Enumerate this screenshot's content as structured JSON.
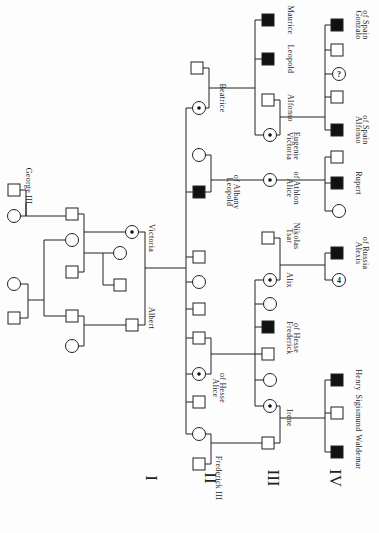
{
  "orientation": "rotated 90° clockwise (generations run left to right)",
  "generations": [
    {
      "label": "I",
      "x": 146,
      "y": 478
    },
    {
      "label": "II",
      "x": 205,
      "y": 478
    },
    {
      "label": "III",
      "x": 268,
      "y": 478
    },
    {
      "label": "IV",
      "x": 330,
      "y": 478
    }
  ],
  "legend_semantics": {
    "square": "male",
    "circle": "female",
    "filled_square": "affected male (hemophilia)",
    "dotted_circle": "carrier female",
    "question_circle": "unknown status female",
    "number_circle": "number of unaffected females"
  },
  "nodes": [
    {
      "id": "george3",
      "shape": "square",
      "x": 14,
      "y": 190,
      "label": "George III",
      "lx": 26,
      "ly": 186
    },
    {
      "id": "g3wife",
      "shape": "circle",
      "x": 14,
      "y": 216
    },
    {
      "id": "edward",
      "shape": "square",
      "x": 72,
      "y": 214
    },
    {
      "id": "aunt1",
      "shape": "circle",
      "x": 72,
      "y": 240
    },
    {
      "id": "aunt2",
      "shape": "square",
      "x": 72,
      "y": 272
    },
    {
      "id": "uncle1",
      "shape": "circle",
      "x": 14,
      "y": 284
    },
    {
      "id": "uncle1m",
      "shape": "square",
      "x": 14,
      "y": 318
    },
    {
      "id": "ernst",
      "shape": "square",
      "x": 72,
      "y": 316
    },
    {
      "id": "ernstw",
      "shape": "circle",
      "x": 72,
      "y": 346
    },
    {
      "id": "vsib1",
      "shape": "circle",
      "x": 120,
      "y": 253
    },
    {
      "id": "vsib2",
      "shape": "square",
      "x": 120,
      "y": 285
    },
    {
      "id": "victoria",
      "shape": "circle",
      "state": "carrier",
      "x": 132,
      "y": 232,
      "label": "Victoria",
      "lx": 149,
      "ly": 238
    },
    {
      "id": "albert",
      "shape": "square",
      "x": 132,
      "y": 325,
      "label": "Albert",
      "lx": 149,
      "ly": 318
    },
    {
      "id": "beatrice_h",
      "shape": "square",
      "x": 197,
      "y": 68
    },
    {
      "id": "beatrice",
      "shape": "circle",
      "state": "carrier",
      "x": 199,
      "y": 108,
      "label": "Beatrice",
      "lx": 220,
      "ly": 98
    },
    {
      "id": "leopold_w",
      "shape": "circle",
      "x": 199,
      "y": 155
    },
    {
      "id": "leopold",
      "shape": "square",
      "state": "affected",
      "x": 199,
      "y": 192,
      "label": "Leopold",
      "lx": 227,
      "ly": 192,
      "label2": "of Albany",
      "lx2": 234,
      "ly2": 192
    },
    {
      "id": "ii_5",
      "shape": "square",
      "x": 199,
      "y": 257
    },
    {
      "id": "ii_6",
      "shape": "circle",
      "x": 199,
      "y": 282
    },
    {
      "id": "ii_7",
      "shape": "square",
      "x": 199,
      "y": 309
    },
    {
      "id": "ii_8",
      "shape": "square",
      "x": 199,
      "y": 338
    },
    {
      "id": "alice",
      "shape": "circle",
      "state": "carrier",
      "x": 199,
      "y": 374,
      "label": "Alice",
      "lx": 213,
      "ly": 388,
      "label2": "of Hesse",
      "lx2": 220,
      "ly2": 388
    },
    {
      "id": "ii_10",
      "shape": "square",
      "x": 199,
      "y": 402
    },
    {
      "id": "vicky",
      "shape": "circle",
      "x": 199,
      "y": 434
    },
    {
      "id": "fred3",
      "shape": "square",
      "x": 199,
      "y": 464,
      "label": "Frederick III",
      "lx": 216,
      "ly": 478
    },
    {
      "id": "maurice",
      "shape": "square",
      "state": "affected",
      "x": 268,
      "y": 20,
      "label": "Maurice",
      "lx": 288,
      "ly": 20
    },
    {
      "id": "leopold_b",
      "shape": "square",
      "state": "affected",
      "x": 268,
      "y": 59,
      "label": "Leopold",
      "lx": 288,
      "ly": 59
    },
    {
      "id": "alfonso13",
      "shape": "square",
      "x": 268,
      "y": 100,
      "label": "Alfonso",
      "lx": 288,
      "ly": 108
    },
    {
      "id": "vic_eug",
      "shape": "circle",
      "state": "carrier",
      "x": 270,
      "y": 135,
      "label": "Victoria",
      "lx": 287,
      "ly": 146,
      "label2": "Eugenie",
      "lx2": 294,
      "ly2": 146
    },
    {
      "id": "alice_ath",
      "shape": "circle",
      "state": "carrier",
      "x": 270,
      "y": 180,
      "label": "Alice",
      "lx": 287,
      "ly": 188,
      "label2": "of Athlon",
      "lx2": 294,
      "ly2": 188
    },
    {
      "id": "nicholas",
      "shape": "square",
      "x": 268,
      "y": 238,
      "label": "Tsar",
      "lx": 287,
      "ly": 236,
      "label2": "Nikolas",
      "lx2": 294,
      "ly2": 236
    },
    {
      "id": "alix",
      "shape": "circle",
      "state": "carrier",
      "x": 270,
      "y": 280,
      "label": "Alix",
      "lx": 287,
      "ly": 280
    },
    {
      "id": "iii_h2",
      "shape": "circle",
      "x": 270,
      "y": 304
    },
    {
      "id": "fred_hesse",
      "shape": "square",
      "state": "affected",
      "x": 268,
      "y": 327,
      "label": "Frederick",
      "lx": 287,
      "ly": 338,
      "label2": "of Hesse",
      "lx2": 294,
      "ly2": 338
    },
    {
      "id": "iii_h4",
      "shape": "square",
      "x": 268,
      "y": 354
    },
    {
      "id": "iii_h5",
      "shape": "circle",
      "x": 270,
      "y": 380
    },
    {
      "id": "irene",
      "shape": "circle",
      "state": "carrier",
      "x": 270,
      "y": 406,
      "label": "Irene",
      "lx": 287,
      "ly": 418
    },
    {
      "id": "henry_pr",
      "shape": "square",
      "x": 268,
      "y": 443
    },
    {
      "id": "gonzalo",
      "shape": "square",
      "state": "affected",
      "x": 337,
      "y": 25,
      "label": "Gonzalo",
      "lx": 356,
      "ly": 25,
      "label2": "of Spain",
      "lx2": 363,
      "ly2": 25
    },
    {
      "id": "iv_s2",
      "shape": "square",
      "x": 337,
      "y": 50
    },
    {
      "id": "iv_s3",
      "shape": "circle",
      "state": "question",
      "x": 339,
      "y": 74
    },
    {
      "id": "iv_s4",
      "shape": "square",
      "x": 337,
      "y": 97
    },
    {
      "id": "alfonso_sp",
      "shape": "square",
      "state": "affected",
      "x": 337,
      "y": 130,
      "label": "Alfonso",
      "lx": 356,
      "ly": 130,
      "label2": "of Spain",
      "lx2": 363,
      "ly2": 130
    },
    {
      "id": "iv_a1",
      "shape": "square",
      "x": 337,
      "y": 157
    },
    {
      "id": "rupert",
      "shape": "square",
      "state": "affected",
      "x": 337,
      "y": 183,
      "label": "Rupert",
      "lx": 356,
      "ly": 183
    },
    {
      "id": "iv_a3",
      "shape": "circle",
      "x": 339,
      "y": 211
    },
    {
      "id": "alexis",
      "shape": "square",
      "state": "affected",
      "x": 337,
      "y": 253,
      "label": "Alexis",
      "lx": 356,
      "ly": 253,
      "label2": "of Russia",
      "lx2": 363,
      "ly2": 253
    },
    {
      "id": "iv_r2",
      "shape": "circle",
      "state": "count",
      "count": "4",
      "x": 339,
      "y": 280
    },
    {
      "id": "henry",
      "shape": "square",
      "state": "affected",
      "x": 337,
      "y": 380,
      "label": "Henry",
      "lx": 356,
      "ly": 380
    },
    {
      "id": "sigismund",
      "shape": "square",
      "x": 337,
      "y": 413,
      "label": "Sigismund",
      "lx": 356,
      "ly": 413
    },
    {
      "id": "waldemar",
      "shape": "square",
      "state": "affected",
      "x": 337,
      "y": 452,
      "label": "Waldemar",
      "lx": 356,
      "ly": 452
    }
  ],
  "symbols": {
    "question_mark": "?",
    "count_four": "4"
  }
}
